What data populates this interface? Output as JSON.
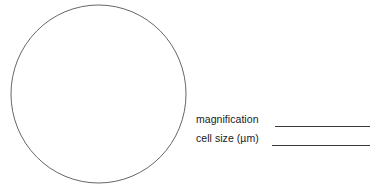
{
  "page": {
    "background_color": "#ffffff",
    "width": 375,
    "height": 189
  },
  "field_of_view": {
    "name": "circle-outline",
    "description": "Large empty circle representing the microscope field of view",
    "stroke_color": "#555555",
    "fill_color": "none",
    "stroke_width": 0.9,
    "center_x": 98.5,
    "center_y": 94,
    "radius_x": 87.5,
    "radius_y": 89
  },
  "answers": {
    "blank_line_color": "#3a3a3a",
    "rows": [
      {
        "label": "magnification",
        "value": "",
        "blank": true
      },
      {
        "label": "cell size (µm)",
        "value": "",
        "blank": true
      }
    ]
  }
}
